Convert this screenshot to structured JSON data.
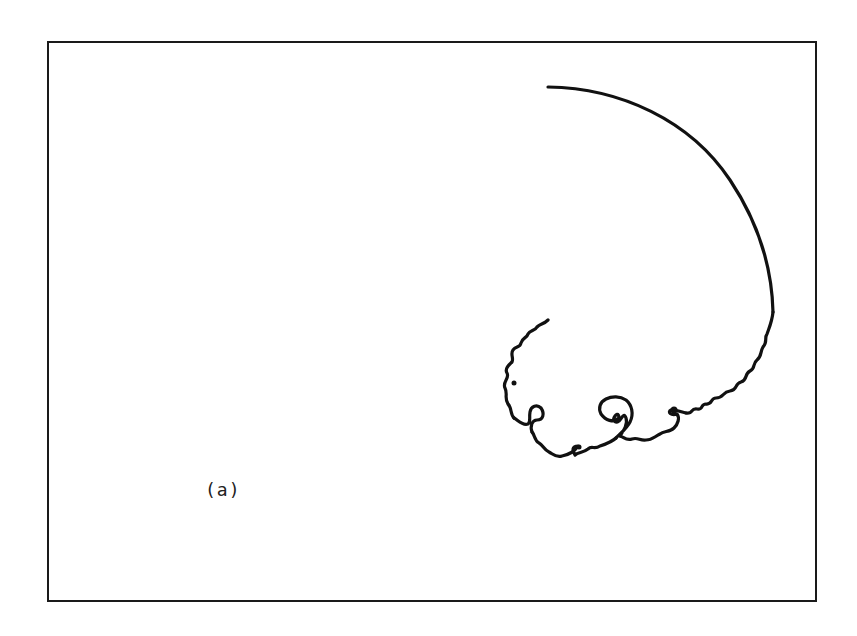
{
  "figure": {
    "panel_label": "(a)",
    "frame_color": "#1a1a1a",
    "curve_color": "#111111"
  }
}
